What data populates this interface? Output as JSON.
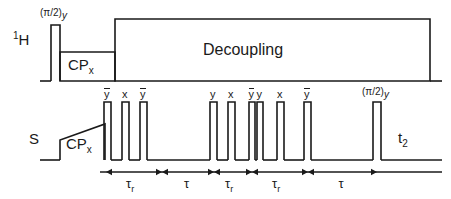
{
  "figure": {
    "type": "nmr-pulse-sequence",
    "background": "#ffffff",
    "stroke": "#1a1a1a"
  },
  "channels": [
    {
      "id": "proton",
      "name": "1H",
      "sup": "1",
      "base": "H",
      "label_x": 18,
      "label_y": 40,
      "baseline_y": 81
    },
    {
      "id": "sspin",
      "name": "S",
      "base": "S",
      "label_x": 30,
      "label_y": 140,
      "baseline_y": 160
    }
  ],
  "proton_channel": {
    "excitation_pulse": {
      "label_main": "(π/2)",
      "label_sub": "y",
      "x": 51,
      "width": 9,
      "top": 25
    },
    "cp_block": {
      "label_main": "CP",
      "label_sub": "x",
      "x": 60,
      "width": 55,
      "top": 52
    },
    "decoupling_block": {
      "label": "Decoupling",
      "x": 115,
      "width": 315,
      "top": 19
    }
  },
  "s_channel": {
    "cp_block": {
      "label_main": "CP",
      "label_sub": "x",
      "x": 60,
      "width": 45,
      "top_left": 140,
      "top_right": 124
    },
    "acquisition": {
      "label_main": "t",
      "label_sub": "2"
    },
    "final_pulse": {
      "label_main": "(π/2)",
      "label_sub": "y",
      "x": 373,
      "width": 8,
      "top": 102
    },
    "pulses": [
      {
        "phase": "y",
        "overbar": true,
        "x": 104,
        "width": 7,
        "top": 102
      },
      {
        "phase": "x",
        "overbar": false,
        "x": 122,
        "width": 7,
        "top": 102
      },
      {
        "phase": "y",
        "overbar": true,
        "x": 140,
        "width": 7,
        "top": 102
      },
      {
        "phase": "y",
        "overbar": false,
        "x": 210,
        "width": 7,
        "top": 102
      },
      {
        "phase": "x",
        "overbar": false,
        "x": 228,
        "width": 7,
        "top": 102
      },
      {
        "phase": "y",
        "overbar": true,
        "x": 249,
        "width": 6,
        "top": 102
      },
      {
        "phase": "y",
        "overbar": false,
        "x": 257,
        "width": 6,
        "top": 102
      },
      {
        "phase": "x",
        "overbar": false,
        "x": 277,
        "width": 7,
        "top": 102
      },
      {
        "phase": "y",
        "overbar": true,
        "x": 304,
        "width": 7,
        "top": 102
      }
    ]
  },
  "timing": {
    "axis_y": 172,
    "intervals": [
      {
        "id": "tau-r-1",
        "label_main": "τ",
        "label_sub": "r",
        "x1": 106,
        "x2": 162,
        "arrows": "both"
      },
      {
        "id": "tau-1",
        "label_main": "τ",
        "label_sub": "",
        "x1": 162,
        "x2": 214,
        "arrows": "both"
      },
      {
        "id": "tau-r-2",
        "label_main": "τ",
        "label_sub": "r",
        "x1": 214,
        "x2": 252,
        "arrows": "both"
      },
      {
        "id": "tau-r-3",
        "label_main": "τ",
        "label_sub": "r",
        "x1": 252,
        "x2": 308,
        "arrows": "both"
      },
      {
        "id": "tau-2",
        "label_main": "τ",
        "label_sub": "",
        "x1": 308,
        "x2": 377,
        "arrows": "both"
      }
    ]
  }
}
